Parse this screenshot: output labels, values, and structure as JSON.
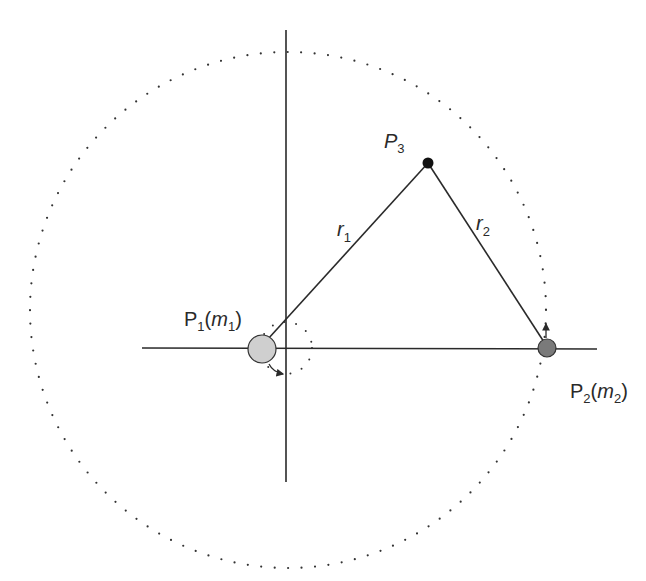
{
  "diagram": {
    "labels": {
      "p1_main": "P",
      "p1_sub": "1",
      "p1_open": "(",
      "p1_mass": "m",
      "p1_mass_sub": "1",
      "p1_close": ")",
      "p2_main": "P",
      "p2_sub": "2",
      "p2_open": "(",
      "p2_mass": "m",
      "p2_mass_sub": "2",
      "p2_close": ")",
      "p3_main": "P",
      "p3_sub": "3",
      "r1_main": "r",
      "r1_sub": "1",
      "r2_main": "r",
      "r2_sub": "2"
    },
    "bodies": [
      {
        "id": "P1",
        "x": 262,
        "y": 348,
        "r": 14,
        "fill": "#cfcfcf"
      },
      {
        "id": "P2",
        "x": 547,
        "y": 348,
        "r": 9,
        "fill": "#7a7a7a"
      },
      {
        "id": "P3",
        "x": 428,
        "y": 163,
        "r": 5,
        "fill": "#111111"
      }
    ],
    "orbit_circle": {
      "cx": 288,
      "cy": 310,
      "r": 258,
      "style": "dotted"
    },
    "axes": {
      "vertical": {
        "x": 286,
        "y1": 30,
        "y2": 482
      },
      "horizontal": {
        "y": 348,
        "x1": 142,
        "x2": 597
      }
    },
    "colors": {
      "line": "#2a2a2a",
      "background": "#ffffff"
    }
  }
}
